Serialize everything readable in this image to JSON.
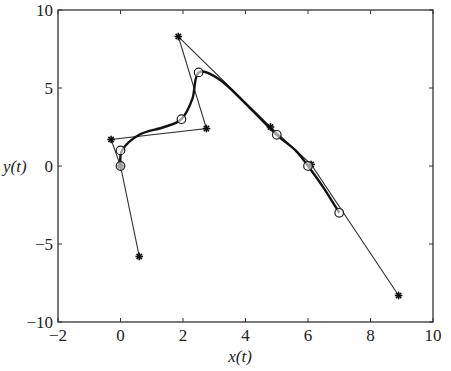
{
  "chart_data": {
    "type": "line",
    "title": "",
    "xlabel": "x(t)",
    "ylabel": "y(t)",
    "xlim": [
      -2,
      10
    ],
    "ylim": [
      -10,
      10
    ],
    "xticks": [
      -2,
      0,
      2,
      4,
      6,
      8,
      10
    ],
    "yticks": [
      -10,
      -5,
      0,
      5,
      10
    ],
    "xtick_labels": [
      "−2",
      "0",
      "2",
      "4",
      "6",
      "8",
      "10"
    ],
    "ytick_labels": [
      "−10",
      "−5",
      "0",
      "5",
      "10"
    ],
    "grid": false,
    "legend": null,
    "series": [
      {
        "name": "control polygon",
        "style": "thin line with star markers",
        "x": [
          0.6,
          0.0,
          -0.3,
          2.75,
          1.85,
          4.8,
          6.1,
          8.9
        ],
        "y": [
          -5.8,
          0.0,
          1.7,
          2.4,
          8.3,
          2.5,
          0.1,
          -8.3
        ]
      },
      {
        "name": "interpolated points",
        "style": "open circle markers",
        "x": [
          0.0,
          0.0,
          1.95,
          2.5,
          5.0,
          6.0,
          7.0
        ],
        "y": [
          0.0,
          1.0,
          3.0,
          6.0,
          2.0,
          0.0,
          -3.0
        ]
      },
      {
        "name": "spline curve",
        "style": "thick solid line",
        "x": [
          0.0,
          0.05,
          0.6,
          1.4,
          1.95,
          2.3,
          2.5,
          3.2,
          4.2,
          5.0,
          5.6,
          6.0,
          6.5,
          7.0
        ],
        "y": [
          0.0,
          1.0,
          2.0,
          2.5,
          3.0,
          4.3,
          6.0,
          5.5,
          3.6,
          2.0,
          1.0,
          0.0,
          -1.4,
          -3.0
        ]
      }
    ]
  }
}
